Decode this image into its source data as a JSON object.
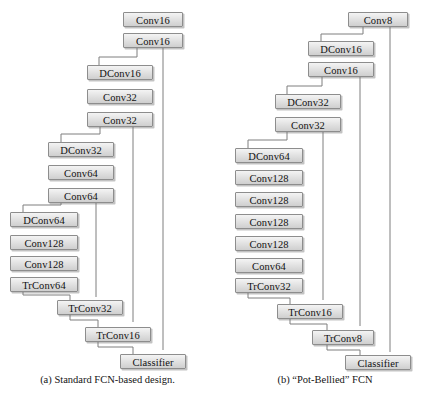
{
  "figure": {
    "kind": "neural-network-architecture-comparison",
    "line_color": "#7a7a7a",
    "box_fill": "#e3e3e3",
    "box_border": "#8d8d8d"
  },
  "panels": [
    {
      "id": "a",
      "caption": "(a) Standard FCN-based design.",
      "stages": [
        {
          "left": 123,
          "nodes": [
            {
              "label": "Conv16",
              "top": 12,
              "width": 60
            },
            {
              "label": "Conv16",
              "top": 33,
              "width": 60
            }
          ]
        },
        {
          "left": 87,
          "nodes": [
            {
              "label": "DConv16",
              "top": 65,
              "width": 66
            },
            {
              "label": "Conv32",
              "top": 89,
              "width": 66
            },
            {
              "label": "Conv32",
              "top": 112,
              "width": 66
            }
          ]
        },
        {
          "left": 48,
          "nodes": [
            {
              "label": "DConv32",
              "top": 142,
              "width": 66
            },
            {
              "label": "Conv64",
              "top": 165,
              "width": 66
            },
            {
              "label": "Conv64",
              "top": 188,
              "width": 66
            }
          ]
        },
        {
          "left": 10,
          "nodes": [
            {
              "label": "DConv64",
              "top": 212,
              "width": 68
            },
            {
              "label": "Conv128",
              "top": 235,
              "width": 68
            },
            {
              "label": "Conv128",
              "top": 256,
              "width": 68
            },
            {
              "label": "TrConv64",
              "top": 277,
              "width": 68
            }
          ]
        },
        {
          "left": 57,
          "nodes": [
            {
              "label": "TrConv32",
              "top": 300,
              "width": 66
            }
          ]
        },
        {
          "left": 85,
          "nodes": [
            {
              "label": "TrConv16",
              "top": 327,
              "width": 66
            }
          ]
        },
        {
          "left": 120,
          "nodes": [
            {
              "label": "Classifier",
              "top": 354,
              "width": 66
            }
          ]
        }
      ]
    },
    {
      "id": "b",
      "caption": "(b) “Pot-Bellied” FCN",
      "stages": [
        {
          "left": 133,
          "nodes": [
            {
              "label": "Conv8",
              "top": 12,
              "width": 60
            }
          ]
        },
        {
          "left": 93,
          "nodes": [
            {
              "label": "DConv16",
              "top": 41,
              "width": 66
            },
            {
              "label": "Conv16",
              "top": 62,
              "width": 66
            }
          ]
        },
        {
          "left": 60,
          "nodes": [
            {
              "label": "DConv32",
              "top": 94,
              "width": 66
            },
            {
              "label": "Conv32",
              "top": 117,
              "width": 66
            }
          ]
        },
        {
          "left": 20,
          "nodes": [
            {
              "label": "DConv64",
              "top": 148,
              "width": 68
            },
            {
              "label": "Conv128",
              "top": 170,
              "width": 68
            },
            {
              "label": "Conv128",
              "top": 192,
              "width": 68
            },
            {
              "label": "Conv128",
              "top": 214,
              "width": 68
            },
            {
              "label": "Conv128",
              "top": 236,
              "width": 68
            },
            {
              "label": "Conv64",
              "top": 258,
              "width": 68
            },
            {
              "label": "TrConv32",
              "top": 278,
              "width": 68
            }
          ]
        },
        {
          "left": 62,
          "nodes": [
            {
              "label": "TrConv16",
              "top": 304,
              "width": 66
            }
          ]
        },
        {
          "left": 97,
          "nodes": [
            {
              "label": "TrConv8",
              "top": 330,
              "width": 62
            }
          ]
        },
        {
          "left": 130,
          "nodes": [
            {
              "label": "Classifier",
              "top": 355,
              "width": 66
            }
          ]
        }
      ]
    }
  ]
}
